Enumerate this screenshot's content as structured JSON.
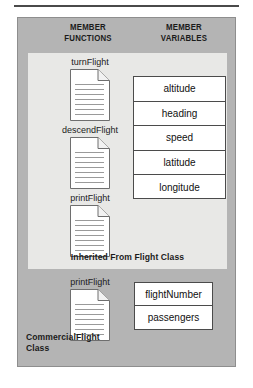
{
  "diagram": {
    "headers": {
      "functions": {
        "line1": "MEMBER",
        "line2": "FUNCTIONS"
      },
      "variables": {
        "line1": "MEMBER",
        "line2": "VARIABLES"
      }
    },
    "inherited_section": {
      "caption": "Inherited From Flight Class",
      "methods": [
        {
          "label": "turnFlight",
          "icon": "document-icon"
        },
        {
          "label": "descendFlight",
          "icon": "document-icon"
        },
        {
          "label": "printFlight",
          "icon": "document-icon"
        }
      ],
      "variables": [
        "altitude",
        "heading",
        "speed",
        "latitude",
        "longitude"
      ]
    },
    "commercial_section": {
      "caption": {
        "line1": "CommercialFlight",
        "line2": "Class"
      },
      "methods": [
        {
          "label": "printFlight",
          "icon": "document-icon"
        }
      ],
      "variables": [
        "flightNumber",
        "passengers"
      ]
    },
    "colors": {
      "panel_gray": "#b4b4b4",
      "inherited_panel": "#e8e8e6",
      "box_fill": "#ffffff",
      "box_border": "#4b4b4b",
      "text": "#1b1b1b",
      "rule": "#4a4a4a"
    }
  }
}
